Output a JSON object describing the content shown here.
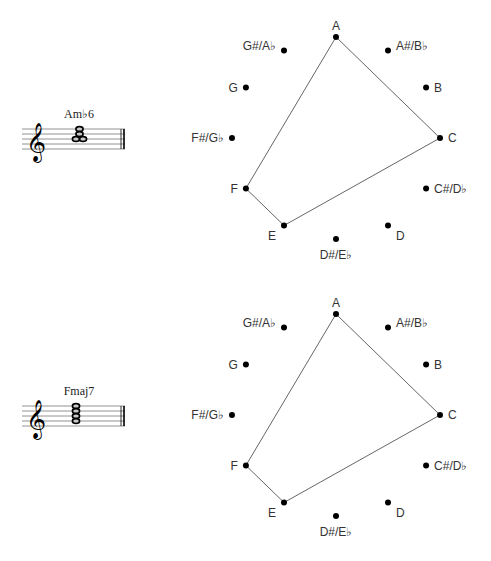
{
  "pitch_classes": [
    "A",
    "A#/B♭",
    "B",
    "C",
    "C#/D♭",
    "D",
    "D#/E♭",
    "E",
    "F",
    "F#/G♭",
    "G",
    "G#/A♭"
  ],
  "clef_glyph": "𝄞",
  "diagrams": [
    {
      "chord_name": "Am♭6",
      "center": [
        336,
        138
      ],
      "radius": 101,
      "staff_top": 129,
      "highlighted": [
        "A",
        "C",
        "E",
        "F"
      ],
      "polygon_order": [
        "A",
        "C",
        "E",
        "F"
      ],
      "notes": [
        {
          "staff_step": 5,
          "dx": 0
        },
        {
          "staff_step": 5,
          "dx": 7
        },
        {
          "staff_step": 3,
          "dx": 3.5
        },
        {
          "staff_step": 1,
          "dx": 3.5
        }
      ]
    },
    {
      "chord_name": "Fmaj7",
      "center": [
        336,
        415
      ],
      "radius": 101,
      "staff_top": 406,
      "highlighted": [
        "A",
        "C",
        "E",
        "F"
      ],
      "polygon_order": [
        "A",
        "C",
        "E",
        "F"
      ],
      "notes": [
        {
          "staff_step": 7,
          "dx": 0
        },
        {
          "staff_step": 5,
          "dx": 0
        },
        {
          "staff_step": 3,
          "dx": 0
        },
        {
          "staff_step": 1,
          "dx": 0
        }
      ]
    }
  ]
}
